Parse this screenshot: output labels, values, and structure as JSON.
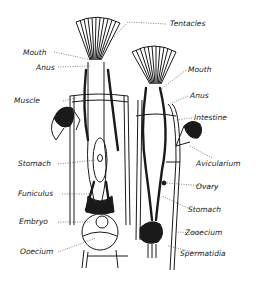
{
  "figure": {
    "ink_color": "#1a1a1a",
    "background": "#ffffff"
  },
  "labels": {
    "tentacles": "Tentacles",
    "mouth_left": "Mouth",
    "anus_left": "Anus",
    "muscle": "Muscle",
    "mouth_right": "Mouth",
    "anus_right": "Anus",
    "intestine": "Intestine",
    "avicularium": "Avicularium",
    "stomach_left": "Stomach",
    "ovary": "Ovary",
    "funiculus": "Funiculus",
    "stomach_right": "Stomach",
    "embryo": "Embryo",
    "zooecium": "Zooecium",
    "ooecium": "Ooecium",
    "spermatidia": "Spermatidia"
  }
}
